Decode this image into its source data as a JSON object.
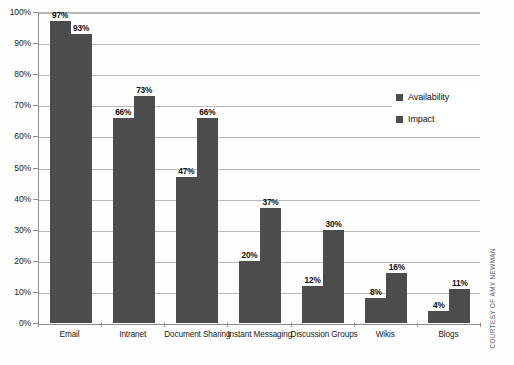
{
  "chart_data": {
    "type": "bar",
    "title": "",
    "subtitle": "",
    "xlabel": "",
    "ylabel": "",
    "ylim": [
      0,
      100
    ],
    "y_unit": "%",
    "grid": true,
    "legend_position": "inside-right",
    "categories": [
      "Email",
      "Intranet",
      "Document Sharing",
      "Instant Messaging",
      "Discussion Groups",
      "Wikis",
      "Blogs"
    ],
    "y_ticks": [
      "0%",
      "10%",
      "20%",
      "30%",
      "40%",
      "50%",
      "60%",
      "70%",
      "80%",
      "90%",
      "100%"
    ],
    "y_tick_values": [
      0,
      10,
      20,
      30,
      40,
      50,
      60,
      70,
      80,
      90,
      100
    ],
    "series": [
      {
        "name": "Availability",
        "color": "#4c4c4c",
        "values": [
          97,
          66,
          47,
          20,
          12,
          8,
          4
        ],
        "labels": [
          "97%",
          "66%",
          "47%",
          "20%",
          "12%",
          "8%",
          "4%"
        ]
      },
      {
        "name": "Impact",
        "color": "#4c4c4c",
        "values": [
          93,
          73,
          66,
          37,
          30,
          16,
          11
        ],
        "labels": [
          "93%",
          "73%",
          "66%",
          "37%",
          "30%",
          "16%",
          "11%"
        ]
      }
    ]
  },
  "legend": {
    "items": [
      {
        "label": "Availability",
        "color": "#4c4c4c"
      },
      {
        "label": "Impact",
        "color": "#4c4c4c"
      }
    ]
  },
  "credit": {
    "text": "COURTESY OF AMY NEWMAN"
  }
}
